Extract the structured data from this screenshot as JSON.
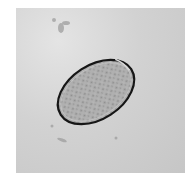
{
  "image": {
    "subject": "oval parasite egg under light microscope",
    "colors": {
      "background": "#cfcfcf",
      "shell": "#1a1a1a",
      "interior": "#a8a8a8",
      "border": "#ffffff"
    }
  }
}
